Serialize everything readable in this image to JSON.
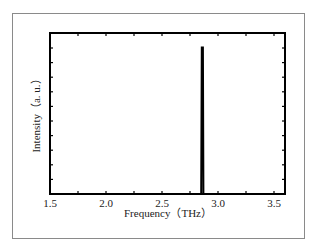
{
  "chart_data": {
    "type": "line",
    "title": "",
    "xlabel": "Frequency（THz）",
    "ylabel": "Intensity（a. u.）",
    "xlim": [
      1.5,
      3.6
    ],
    "ylim": [
      0,
      1.1
    ],
    "x_ticks": [
      "1.5",
      "2.0",
      "2.5",
      "3.0",
      "3.5"
    ],
    "x_tick_values": [
      1.5,
      2.0,
      2.5,
      3.0,
      3.5
    ],
    "y_ticks": [],
    "grid": false,
    "legend": null,
    "series": [
      {
        "name": "spectrum",
        "x": [
          1.5,
          2.85,
          2.855,
          2.86,
          2.865,
          2.87,
          3.6
        ],
        "y": [
          0,
          0,
          1.0,
          1.0,
          1.0,
          0,
          0
        ],
        "color": "#000000"
      }
    ],
    "peak": {
      "x": 2.86,
      "y": 1.0
    }
  }
}
